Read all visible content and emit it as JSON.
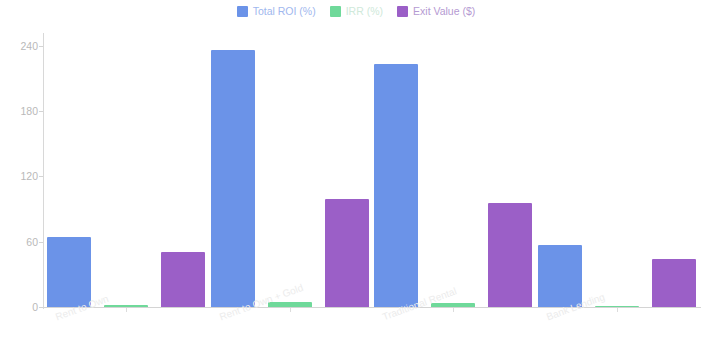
{
  "chart_data": {
    "type": "bar",
    "title": "",
    "subtitle": "",
    "xlabel": "",
    "ylabel": "",
    "categories": [
      "Rent to Own",
      "Rent to Own + Gold",
      "Traditional Rental",
      "Bank Lending"
    ],
    "series": [
      {
        "name": "Total ROI (%)",
        "color": "#6b93e8",
        "values": [
          64,
          236,
          223,
          57
        ]
      },
      {
        "name": "IRR (%)",
        "color": "#6fd99a",
        "values": [
          2,
          5,
          4,
          1
        ]
      },
      {
        "name": "Exit Value ($)",
        "color": "#9b5fc7",
        "values": [
          51,
          99,
          96,
          44
        ]
      }
    ],
    "ylim": [
      0,
      250
    ],
    "yticks": [
      0,
      60,
      120,
      180,
      240
    ],
    "ytick_labels": [
      "0",
      "60",
      "120",
      "180",
      "240"
    ],
    "grid": false,
    "legend_position": "top-center",
    "x_tick_label_rotation": -20
  },
  "legend": {
    "entries": [
      {
        "label": "Total ROI (%)",
        "color": "#6b93e8"
      },
      {
        "label": "IRR (%)",
        "color": "#6fd99a"
      },
      {
        "label": "Exit Value ($)",
        "color": "#9b5fc7"
      }
    ]
  },
  "axes": {
    "y_tick_labels": [
      "240",
      "180",
      "120",
      "60",
      "0"
    ],
    "x_tick_labels": [
      "Rent to Own",
      "Rent to Own + Gold",
      "Traditional Rental",
      "Bank Lending"
    ]
  }
}
